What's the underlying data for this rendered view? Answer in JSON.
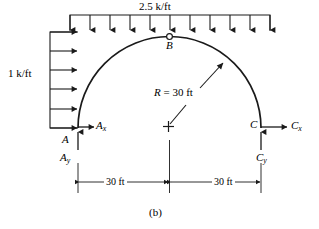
{
  "figure": {
    "caption": "(b)",
    "colors": {
      "line": "#1a1a1a",
      "background": "#ffffff"
    }
  },
  "loads": {
    "top": {
      "magnitude_label": "2.5 k/ft",
      "direction": "down",
      "arrow_count": 11,
      "span_label": "60 ft"
    },
    "left": {
      "magnitude_label": "1 k/ft",
      "direction": "right",
      "arrow_count": 6
    }
  },
  "geometry": {
    "radius_label": "R = 30 ft",
    "radius_symbol": "R",
    "radius_value": "= 30 ft",
    "center_marker": "cross",
    "shape": "semicircular-arch"
  },
  "nodes": {
    "a": {
      "label": "A",
      "reaction_x": "A",
      "reaction_x_sub": "x",
      "reaction_y": "A",
      "reaction_y_sub": "y"
    },
    "b": {
      "label": "B",
      "type": "hinge"
    },
    "c": {
      "label": "C",
      "reaction_x": "C",
      "reaction_x_sub": "x",
      "reaction_y": "C",
      "reaction_y_sub": "y"
    }
  },
  "dimensions": {
    "left_span": "30 ft",
    "right_span": "30 ft"
  }
}
